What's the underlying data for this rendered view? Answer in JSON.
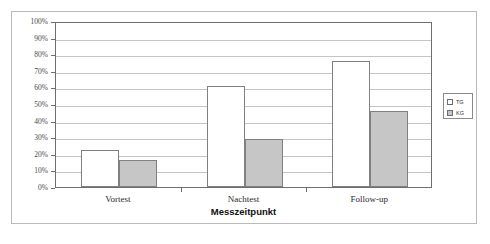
{
  "chart_data": {
    "type": "bar",
    "title": "",
    "subtitle": "",
    "xlabel": "Messzeitpunkt",
    "ylabel": "",
    "categories": [
      "Vortest",
      "Nachtest",
      "Follow-up"
    ],
    "series": [
      {
        "name": "TG",
        "values": [
          22,
          61,
          76
        ],
        "color": "#ffffff"
      },
      {
        "name": "KG",
        "values": [
          16,
          29,
          46
        ],
        "color": "#c6c6c6"
      }
    ],
    "ylim": [
      0,
      100
    ],
    "ytick_labels": [
      "0%",
      "10%",
      "20%",
      "30%",
      "40%",
      "50%",
      "60%",
      "70%",
      "80%",
      "90%",
      "100%"
    ],
    "ytick_values": [
      0,
      10,
      20,
      30,
      40,
      50,
      60,
      70,
      80,
      90,
      100
    ],
    "value_unit": "%",
    "grid": true,
    "legend_position": "right",
    "legend_entries": [
      "TG",
      "KG"
    ]
  },
  "colors": {
    "tg_fill": "#ffffff",
    "kg_fill": "#c6c6c6",
    "bar_border": "#808080",
    "axis": "#6e6e6e",
    "gridline": "#c4c4c4",
    "frame": "#b9b9b9",
    "background": "#ffffff"
  }
}
